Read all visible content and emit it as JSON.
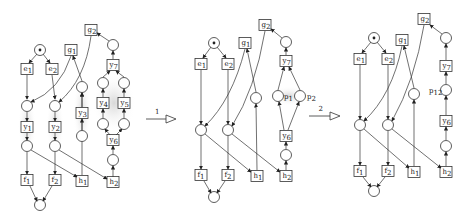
{
  "diagram": {
    "type": "petri-net-reduction",
    "steps": [
      {
        "label": "1"
      },
      {
        "label": "2"
      }
    ],
    "nets": [
      {
        "id": "net-original",
        "transitions": [
          "e1",
          "e2",
          "g1",
          "g2",
          "y1",
          "y2",
          "y3",
          "y4",
          "y5",
          "y6",
          "y7",
          "f1",
          "f2",
          "h1",
          "h2"
        ]
      },
      {
        "id": "net-step1",
        "transitions": [
          "e1",
          "e2",
          "g1",
          "g2",
          "y6",
          "y7",
          "f1",
          "f2",
          "h1",
          "h2"
        ],
        "place_labels": [
          "p1",
          "p2"
        ]
      },
      {
        "id": "net-step2",
        "transitions": [
          "e1",
          "e2",
          "g1",
          "g2",
          "y6",
          "y7",
          "f1",
          "f2",
          "h1",
          "h2"
        ],
        "place_labels": [
          "p12"
        ]
      }
    ]
  }
}
